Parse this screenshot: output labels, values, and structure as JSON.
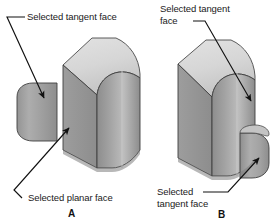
{
  "figure": {
    "type": "cad-isometric-illustration",
    "background_color": "#ffffff",
    "line_color": "#111111",
    "palette": {
      "top_face": "#d9d9d9",
      "top_face_shadow": "#cfcfcf",
      "front_face": "#8f8f8f",
      "side_face": "#9a9a9a",
      "cylinder_light": "#b4b4b4",
      "cylinder_mid": "#9d9d9d",
      "cylinder_dark": "#8a8a8a",
      "curve_highlight": "#c6c6c6",
      "outline": "#3a3a3a"
    }
  },
  "panel_a": {
    "caption": "A",
    "labels": {
      "tangent": "Selected tangent face",
      "planar": "Selected planar face"
    }
  },
  "panel_b": {
    "caption": "B",
    "labels": {
      "tangent_top_line1": "Selected tangent",
      "tangent_top_line2": "face",
      "tangent_bottom_line1": "Selected",
      "tangent_bottom_line2": "tangent face"
    }
  }
}
